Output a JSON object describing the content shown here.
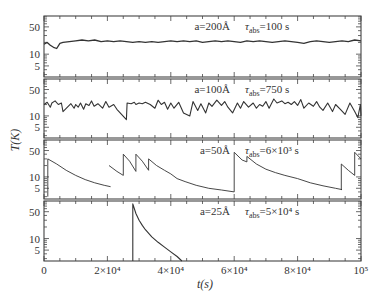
{
  "chart_data": {
    "type": "line",
    "layout": "4 stacked panels sharing x-axis, log-scale y",
    "xlabel": "t(s)",
    "ylabel": "T(K)",
    "xlim": [
      0,
      100000
    ],
    "x_ticks": [
      0,
      20000,
      40000,
      60000,
      80000,
      100000
    ],
    "x_tick_labels": [
      "0",
      "2×10⁴",
      "4×10⁴",
      "6×10⁴",
      "8×10⁴",
      "10⁵"
    ],
    "y_scale": "log",
    "ylim": [
      2.6,
      95
    ],
    "y_ticks": [
      5,
      10,
      50
    ],
    "y_tick_labels": [
      "5",
      "10",
      "50"
    ],
    "grid": false,
    "panels": [
      {
        "name": "a=200Å",
        "annotation_a": "a=200Å",
        "annotation_tau": "τabs=100 s",
        "tau_main": "τ",
        "tau_sub": "abs",
        "tau_value": "=100 s",
        "series": {
          "style": "noisy",
          "x": [
            0,
            1000,
            2000,
            3000,
            4000,
            5000,
            6000,
            8000,
            10000,
            12000,
            14000,
            16000,
            18000,
            20000,
            22000,
            24000,
            26000,
            28000,
            30000,
            32000,
            34000,
            36000,
            38000,
            40000,
            42000,
            44000,
            46000,
            48000,
            50000,
            52000,
            54000,
            56000,
            58000,
            60000,
            62000,
            64000,
            66000,
            68000,
            70000,
            72000,
            74000,
            76000,
            78000,
            80000,
            82000,
            84000,
            86000,
            88000,
            90000,
            92000,
            94000,
            96000,
            98000,
            100000
          ],
          "values": [
            18,
            20,
            17,
            15,
            14,
            19,
            20,
            21,
            22,
            23,
            22,
            23,
            21,
            22,
            21,
            22,
            21,
            20,
            21,
            20,
            21,
            20,
            21,
            22,
            21,
            22,
            21,
            22,
            20,
            21,
            22,
            21,
            22,
            21,
            20,
            22,
            21,
            22,
            21,
            20,
            21,
            22,
            21,
            20,
            19,
            21,
            22,
            21,
            20,
            21,
            22,
            21,
            23,
            22
          ]
        }
      },
      {
        "name": "a=100Å",
        "annotation_a": "a=100Å",
        "annotation_tau": "τabs=750 s",
        "tau_main": "τ",
        "tau_sub": "abs",
        "tau_value": "=750 s",
        "series": {
          "style": "sawtooth",
          "x": [
            0,
            1000,
            2000,
            2500,
            3500,
            4500,
            5500,
            6000,
            8500,
            9500,
            10000,
            10800,
            11500,
            12500,
            13200,
            14200,
            15000,
            15800,
            17000,
            18500,
            19500,
            20500,
            22000,
            23000,
            26000,
            26200,
            27500,
            28500,
            29000,
            30000,
            31000,
            32000,
            33500,
            35000,
            36000,
            37000,
            38000,
            39000,
            40000,
            41000,
            42500,
            44000,
            46000,
            47000,
            48500,
            49500,
            51000,
            52000,
            53000,
            54500,
            56000,
            57000,
            58000,
            59500,
            61000,
            62000,
            63000,
            64500,
            66000,
            67000,
            68000,
            69000,
            70000,
            71000,
            72500,
            73500,
            75000,
            76000,
            77000,
            78000,
            79000,
            80000,
            81000,
            82000,
            83500,
            85000,
            86000,
            87000,
            88000,
            89500,
            91000,
            92000,
            93500,
            95000,
            96500,
            98000,
            99000,
            99800,
            100000
          ],
          "values": [
            20,
            23,
            17,
            22,
            25,
            20,
            22,
            13,
            21,
            16,
            20,
            17,
            22,
            15,
            21,
            19,
            25,
            18,
            21,
            16,
            24,
            17,
            20,
            15,
            8,
            22,
            21,
            23,
            20,
            22,
            21,
            23,
            20,
            16,
            26,
            20,
            23,
            15,
            22,
            16,
            23,
            12,
            10,
            24,
            14,
            21,
            12,
            22,
            18,
            26,
            19,
            24,
            17,
            12,
            22,
            16,
            24,
            17,
            22,
            16,
            20,
            18,
            24,
            16,
            28,
            22,
            25,
            21,
            23,
            20,
            24,
            19,
            27,
            16,
            22,
            18,
            24,
            17,
            14,
            22,
            13,
            20,
            15,
            11,
            22,
            13,
            9,
            20,
            10
          ]
        }
      },
      {
        "name": "a=50Å",
        "annotation_a": "a=50Å",
        "annotation_tau": "τabs=6×10³ s",
        "tau_main": "τ",
        "tau_sub": "abs",
        "tau_value": "=6×10³ s",
        "series": {
          "style": "spikes",
          "segments": [
            {
              "x": [
                1200,
                1200,
                4000,
                7000,
                10000,
                13000,
                16000,
                19000,
                21000
              ],
              "values": [
                3,
                30,
                22,
                15,
                11,
                8.5,
                7,
                6,
                5.5
              ]
            },
            {
              "x": [
                20500,
                23000,
                25000,
                25000,
                27000,
                29000,
                29000,
                31000,
                33000,
                33000,
                35500,
                38000,
                40000,
                42000,
                44500,
                48000,
                52000,
                56000,
                60000,
                60000
              ],
              "values": [
                20,
                14,
                11,
                40,
                26,
                14,
                40,
                26,
                15,
                30,
                20,
                15,
                12,
                9,
                7.5,
                6,
                5,
                4.5,
                4,
                45
              ]
            },
            {
              "x": [
                60000,
                62500,
                64000,
                64000,
                67000,
                70000,
                73000,
                76000,
                80000,
                84000,
                88000,
                92000,
                94000,
                93800,
                93800
              ],
              "values": [
                45,
                28,
                25,
                35,
                22,
                16,
                13,
                11,
                9,
                7,
                5.8,
                5,
                4.6,
                4.6,
                22
              ]
            },
            {
              "x": [
                93800,
                96000,
                98000,
                98000,
                100000,
                103000,
                106000,
                110000,
                114000,
                120000,
                126000,
                132000,
                138000,
                142000
              ],
              "values": [
                22,
                15,
                11,
                45,
                30,
                22,
                18,
                14,
                11,
                8,
                6.2,
                5,
                4,
                3.5
              ]
            },
            {
              "x": [
                142000,
                145000
              ],
              "values": [
                3.5,
                3
              ]
            }
          ],
          "peak_times_approx_s": [
            1200,
            25000,
            29000,
            33000,
            40000,
            60000,
            64000,
            93800,
            98000,
            166000,
            197000
          ]
        }
      },
      {
        "name": "a=25Å",
        "annotation_a": "a=25Å",
        "annotation_tau": "τabs=5×10⁴ s",
        "tau_main": "τ",
        "tau_sub": "abs",
        "tau_value": "=5×10⁴ s",
        "series": {
          "style": "single-spike",
          "x": [
            28000,
            28000,
            29000,
            30000,
            31000,
            32000,
            34000,
            36000,
            38000,
            40000,
            42000,
            43500
          ],
          "values": [
            2.6,
            80,
            45,
            30,
            22,
            17,
            11,
            8,
            6,
            4.5,
            3.4,
            2.6
          ]
        }
      }
    ]
  }
}
